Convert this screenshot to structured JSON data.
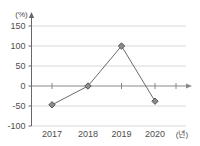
{
  "chart_data": {
    "type": "line",
    "title": "",
    "xlabel": "(년)",
    "ylabel": "(%)",
    "categories": [
      "2017",
      "2018",
      "2019",
      "2020"
    ],
    "values": [
      -47,
      0,
      100,
      -38
    ],
    "series": [
      {
        "name": "",
        "values": [
          -47,
          0,
          100,
          -38
        ]
      }
    ],
    "ylim": [
      -100,
      150
    ],
    "yticks": [
      "150",
      "100",
      "50",
      "0",
      "-50",
      "-100"
    ],
    "ytick_values": [
      150,
      100,
      50,
      0,
      -50,
      -100
    ],
    "xticks": [
      "2017",
      "2018",
      "2019",
      "2020"
    ],
    "grid": true,
    "legend": "none",
    "marker": "diamond",
    "axis_arrows": true,
    "colors": {
      "line": "#6b6b6b",
      "marker_fill": "#8c8c8c",
      "marker_stroke": "#4d4d4d",
      "gridline": "#d8d8d8",
      "axis": "#666666",
      "zero_axis": "#888888",
      "text": "#4d4d4d",
      "background": "#ffffff"
    }
  },
  "axis_units": {
    "y_unit": "(%)",
    "x_unit": "(년)"
  }
}
